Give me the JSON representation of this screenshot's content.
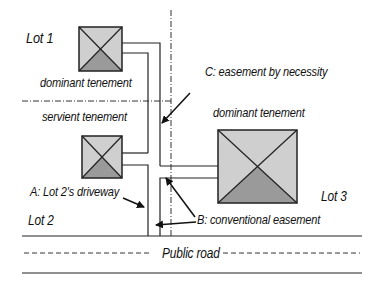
{
  "diagram": {
    "labels": {
      "lot1": "Lot 1",
      "lot2": "Lot 2",
      "lot3": "Lot 3",
      "dominant_tenement_lot1": "dominant tenement",
      "servient_tenement": "servient tenement",
      "dominant_tenement_lot3": "dominant tenement",
      "easement_c": "C: easement by necessity",
      "easement_a": "A: Lot 2's driveway",
      "easement_b": "B: conventional easement",
      "public_road": "Public road"
    },
    "houses": [
      {
        "name": "Lot 1 house",
        "icon": "house-icon"
      },
      {
        "name": "Lot 2 house",
        "icon": "house-icon"
      },
      {
        "name": "Lot 3 house",
        "icon": "house-icon"
      }
    ],
    "colors": {
      "house_light": "#cfcfcf",
      "house_dark": "#9a9a9a",
      "line": "#222222",
      "background": "#ffffff"
    }
  }
}
